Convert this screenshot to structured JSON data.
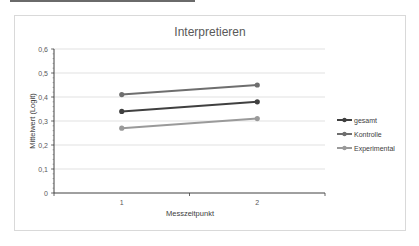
{
  "chart_data": {
    "type": "line",
    "title": "Interpretieren",
    "xlabel": "Messzeitpunkt",
    "ylabel": "Mittelwert (Logit)",
    "categories": [
      "1",
      "2"
    ],
    "ylim": [
      0,
      0.6
    ],
    "yticks": [
      "0",
      "0,1",
      "0,2",
      "0,3",
      "0,4",
      "0,5",
      "0,6"
    ],
    "ytick_values": [
      0,
      0.1,
      0.2,
      0.3,
      0.4,
      0.5,
      0.6
    ],
    "grid": true,
    "legend_position": "right",
    "series": [
      {
        "name": "gesamt",
        "values": [
          0.34,
          0.38
        ],
        "color": "#404040"
      },
      {
        "name": "Kontrolle",
        "values": [
          0.41,
          0.45
        ],
        "color": "#6e6e6e"
      },
      {
        "name": "Experimental",
        "values": [
          0.27,
          0.31
        ],
        "color": "#9a9a9a"
      }
    ]
  }
}
